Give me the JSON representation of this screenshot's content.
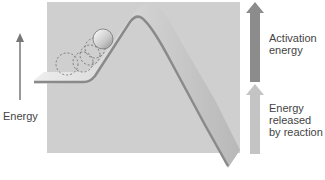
{
  "diagram": {
    "axis_label": "Energy",
    "activation_label_line1": "Activation",
    "activation_label_line2": "energy",
    "released_label_line1": "Energy",
    "released_label_line2": "released",
    "released_label_line3": "by reaction",
    "colors": {
      "panel": "#cfcfcf",
      "track_top": "#bdbdbd",
      "track_edge": "#8a8a8a",
      "activation_arrow": "#8c8c8c",
      "released_arrow": "#c4c4c4",
      "axis_arrow": "#777777",
      "ball": "#d8d8d8"
    }
  }
}
